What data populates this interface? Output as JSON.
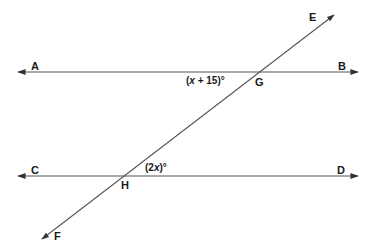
{
  "diagram": {
    "type": "parallel-lines-transversal",
    "colors": {
      "line": "#444444",
      "text": "#1a1a1a",
      "background": "#ffffff"
    },
    "lines": [
      {
        "name": "AB",
        "from": "A",
        "to": "B"
      },
      {
        "name": "CD",
        "from": "C",
        "to": "D"
      },
      {
        "name": "EF",
        "from": "E",
        "to": "F",
        "role": "transversal"
      }
    ],
    "points": {
      "A": "A",
      "B": "B",
      "C": "C",
      "D": "D",
      "E": "E",
      "F": "F",
      "G": "G",
      "H": "H"
    },
    "angles": {
      "at_G": {
        "prefix": "(",
        "var": "x",
        "suffix": " + 15)°"
      },
      "at_H": {
        "prefix": "(2",
        "var": "x",
        "suffix": ")°"
      }
    }
  }
}
